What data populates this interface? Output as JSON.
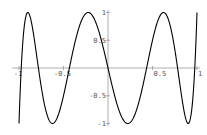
{
  "chart_data": {
    "type": "line",
    "title": "",
    "xlabel": "",
    "ylabel": "",
    "xlim": [
      -1,
      1
    ],
    "ylim": [
      -1,
      1
    ],
    "grid": false,
    "legend": null,
    "x_ticks": [
      {
        "value": -1,
        "label": "-1"
      },
      {
        "value": -0.5,
        "label": "-0.5"
      },
      {
        "value": 0.5,
        "label": "0.5"
      },
      {
        "value": 1,
        "label": "1"
      }
    ],
    "y_ticks": [
      {
        "value": 1,
        "label": "1"
      },
      {
        "value": 0.5,
        "label": "0.5"
      },
      {
        "value": -0.5,
        "label": "-0.5"
      },
      {
        "value": -1,
        "label": "-1"
      }
    ],
    "series": [
      {
        "name": "curve",
        "color": "#000000",
        "x": [
          -1,
          -0.975,
          -0.901,
          -0.782,
          -0.623,
          -0.434,
          -0.223,
          0,
          0.223,
          0.434,
          0.623,
          0.782,
          0.901,
          0.975,
          1
        ],
        "y": [
          -1,
          0,
          1,
          0,
          -1,
          0,
          1,
          0,
          -1,
          0,
          1,
          0,
          -1,
          0,
          1
        ]
      }
    ]
  }
}
